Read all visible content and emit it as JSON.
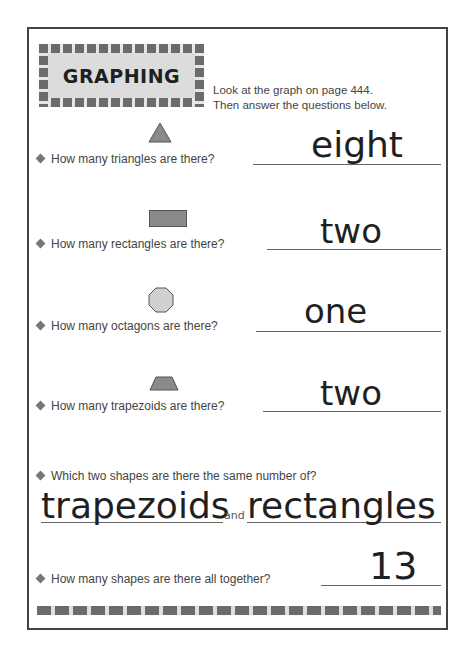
{
  "header": {
    "title": "GRAPHING",
    "instructions": [
      "Look at the graph on page 444.",
      "Then answer the questions below."
    ]
  },
  "questions": [
    {
      "shape": "triangle-icon",
      "text": "How many triangles are there?",
      "answer": "eight"
    },
    {
      "shape": "rectangle-icon",
      "text": "How many rectangles are there?",
      "answer": "two"
    },
    {
      "shape": "octagon-icon",
      "text": "How many octagons are there?",
      "answer": "one"
    },
    {
      "shape": "trapezoid-icon",
      "text": "How many trapezoids are there?",
      "answer": "two"
    },
    {
      "text": "Which two shapes are there the same number of?",
      "answer_a": "trapezoids",
      "connector": "and",
      "answer_b": "rectangles"
    },
    {
      "text": "How many shapes are there all together?",
      "answer": "13"
    }
  ],
  "colors": {
    "border": "#444444",
    "shape_fill": "#8a8a8a",
    "octagon_fill": "#d0d0d0",
    "header_bg": "#dcdcdc"
  }
}
